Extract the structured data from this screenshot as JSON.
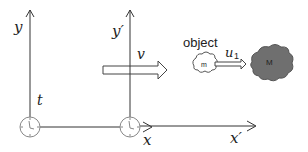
{
  "diagram": {
    "frame_s": {
      "y_axis_label": "y",
      "x_axis_label": "x",
      "clock_label": "t"
    },
    "frame_s_prime": {
      "y_axis_label": "y′",
      "x_axis_label": "x′"
    },
    "velocity_arrow": {
      "label": "v"
    },
    "object": {
      "caption": "object",
      "small_mass_label": "m",
      "velocity_label": "u",
      "velocity_subscript": "1",
      "large_mass_label": "M"
    },
    "colors": {
      "line": "#333333",
      "clock": "#888888",
      "dark_cloud": "#6f6f6f",
      "light_cloud_stroke": "#555555"
    }
  }
}
